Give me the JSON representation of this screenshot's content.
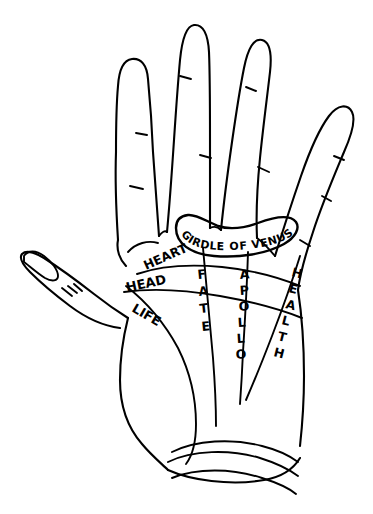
{
  "diagram": {
    "background_color": "#ffffff",
    "ink_color": "#000000",
    "style": "hand-drawn black ink line art"
  },
  "labels": {
    "girdle_of_venus": "GIRDLE OF VENUS",
    "heart": "HEART",
    "head": "HEAD",
    "life": "LIFE",
    "fate": "FATE",
    "apollo": "APOLLO",
    "health": "HEALTH"
  },
  "stacked": {
    "fate_letters": [
      "F",
      "A",
      "T",
      "E"
    ],
    "apollo_letters": [
      "A",
      "P",
      "O",
      "L",
      "L",
      "O"
    ],
    "health_letters": [
      "H",
      "E",
      "A",
      "L",
      "T",
      "H"
    ]
  },
  "lines": [
    {
      "name": "girdle-of-venus",
      "label": "GIRDLE OF VENUS",
      "orientation": "arc-over-middle-fingers"
    },
    {
      "name": "heart-line",
      "label": "HEART",
      "orientation": "horizontal-upper-palm"
    },
    {
      "name": "head-line",
      "label": "HEAD",
      "orientation": "horizontal-mid-palm"
    },
    {
      "name": "life-line",
      "label": "LIFE",
      "orientation": "curves-around-thumb-ball"
    },
    {
      "name": "fate-line",
      "label": "FATE",
      "orientation": "vertical-center-palm"
    },
    {
      "name": "apollo-line",
      "label": "APOLLO",
      "orientation": "vertical-ring-finger"
    },
    {
      "name": "health-line",
      "label": "HEALTH",
      "orientation": "diagonal-lower-right"
    }
  ],
  "anatomy": {
    "fingers": [
      "index",
      "middle",
      "ring",
      "little"
    ],
    "thumb": "thumb",
    "wrist_bracelets": 3
  }
}
